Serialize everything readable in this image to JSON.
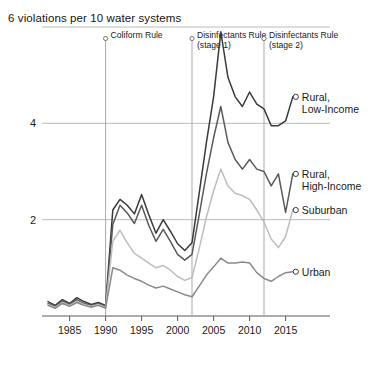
{
  "chart_data": {
    "type": "line",
    "title": "6 violations per 10 water systems",
    "xlabel": "",
    "ylabel": "",
    "xlim": [
      1982,
      2017
    ],
    "ylim": [
      0,
      6
    ],
    "grid": "horizontal",
    "legend_position": "right-inline",
    "y_ticks": [
      2,
      4,
      6
    ],
    "y_tick_labels": [
      "2",
      "4",
      "6"
    ],
    "x_ticks": [
      1985,
      1990,
      1995,
      2000,
      2005,
      2010,
      2015
    ],
    "x_tick_labels": [
      "1985",
      "1990",
      "1995",
      "2000",
      "2005",
      "2010",
      "2015"
    ],
    "annotations": [
      {
        "label": "Coliform Rule",
        "sublabel": "",
        "x": 1990
      },
      {
        "label": "Disinfectants Rule",
        "sublabel": "(stage 1)",
        "x": 2002
      },
      {
        "label": "Disinfectants Rule",
        "sublabel": "(stage 2)",
        "x": 2012
      }
    ],
    "x": [
      1982,
      1983,
      1984,
      1985,
      1986,
      1987,
      1988,
      1989,
      1990,
      1991,
      1992,
      1993,
      1994,
      1995,
      1996,
      1997,
      1998,
      1999,
      2000,
      2001,
      2002,
      2003,
      2004,
      2005,
      2006,
      2007,
      2008,
      2009,
      2010,
      2011,
      2012,
      2013,
      2014,
      2015,
      2016
    ],
    "series": [
      {
        "name": "Rural, Low-Income",
        "color": "#3a3a3a",
        "label_line1": "Rural,",
        "label_line2": "Low-Income",
        "values": [
          0.3,
          0.22,
          0.34,
          0.26,
          0.38,
          0.3,
          0.24,
          0.28,
          0.22,
          2.2,
          2.42,
          2.3,
          2.12,
          2.52,
          2.1,
          1.72,
          2.0,
          1.76,
          1.5,
          1.36,
          1.52,
          2.55,
          3.6,
          4.55,
          5.9,
          4.95,
          4.55,
          4.35,
          4.65,
          4.4,
          4.3,
          3.95,
          3.95,
          4.05,
          4.55
        ]
      },
      {
        "name": "Rural, High-Income",
        "color": "#5a5a5a",
        "label_line1": "Rural,",
        "label_line2": "High-Income",
        "values": [
          0.26,
          0.2,
          0.3,
          0.24,
          0.34,
          0.26,
          0.22,
          0.26,
          0.2,
          1.9,
          2.3,
          2.14,
          1.92,
          2.3,
          1.88,
          1.55,
          1.8,
          1.55,
          1.28,
          1.16,
          1.28,
          2.1,
          2.95,
          3.7,
          4.35,
          3.6,
          3.25,
          3.05,
          3.25,
          3.05,
          3.0,
          2.7,
          2.95,
          2.15,
          2.95
        ]
      },
      {
        "name": "Suburban",
        "color": "#bdbdbd",
        "label_line1": "Suburban",
        "label_line2": "",
        "values": [
          0.24,
          0.18,
          0.28,
          0.22,
          0.3,
          0.24,
          0.2,
          0.24,
          0.18,
          1.55,
          1.78,
          1.52,
          1.3,
          1.2,
          1.1,
          1.0,
          1.05,
          0.95,
          0.82,
          0.74,
          0.8,
          1.4,
          2.05,
          2.6,
          3.05,
          2.7,
          2.55,
          2.5,
          2.42,
          2.2,
          1.95,
          1.6,
          1.42,
          1.65,
          2.2
        ]
      },
      {
        "name": "Urban",
        "color": "#8a8a8a",
        "label_line1": "Urban",
        "label_line2": "",
        "values": [
          0.22,
          0.16,
          0.26,
          0.2,
          0.28,
          0.22,
          0.18,
          0.22,
          0.16,
          1.0,
          0.95,
          0.85,
          0.78,
          0.72,
          0.64,
          0.58,
          0.62,
          0.56,
          0.5,
          0.44,
          0.4,
          0.62,
          0.85,
          1.02,
          1.2,
          1.1,
          1.1,
          1.12,
          1.1,
          0.9,
          0.78,
          0.72,
          0.82,
          0.9,
          0.92
        ]
      }
    ]
  }
}
